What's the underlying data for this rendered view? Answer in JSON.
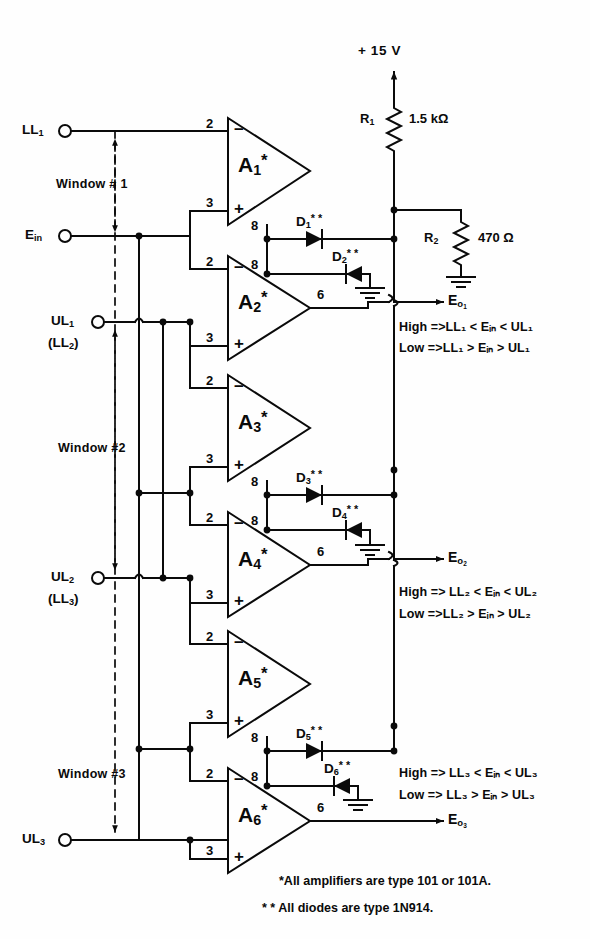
{
  "figure": {
    "type": "schematic",
    "supply": {
      "label": "+ 15 V"
    },
    "footnotes": [
      "*All amplifiers are type 101 or 101A.",
      "* * All diodes are type 1N914."
    ]
  },
  "terminals": [
    {
      "name": "ll1",
      "label": "LL",
      "sub": "1"
    },
    {
      "name": "ein",
      "label": "E",
      "sub": "in"
    },
    {
      "name": "ul1",
      "label": "UL",
      "sub": "1"
    },
    {
      "name": "ul1b",
      "label": "(LL",
      "sub": "2",
      "tail": ")"
    },
    {
      "name": "ul2",
      "label": "UL",
      "sub": "2"
    },
    {
      "name": "ul2b",
      "label": "(LL",
      "sub": "3",
      "tail": ")"
    },
    {
      "name": "ul3",
      "label": "UL",
      "sub": "3"
    }
  ],
  "windows": [
    {
      "label": "Window # 1"
    },
    {
      "label": "Window #2"
    },
    {
      "label": "Window  #3"
    }
  ],
  "amplifiers": [
    {
      "name": "a1",
      "label": "A",
      "sub": "1",
      "star": "*",
      "pin_minus": "2",
      "pin_plus": "3",
      "pin_8": "8",
      "pin_out": ""
    },
    {
      "name": "a2",
      "label": "A",
      "sub": "2",
      "star": "*",
      "pin_minus": "2",
      "pin_plus": "3",
      "pin_8": "8",
      "pin_out": "6"
    },
    {
      "name": "a3",
      "label": "A",
      "sub": "3",
      "star": "*",
      "pin_minus": "2",
      "pin_plus": "3",
      "pin_8": "8",
      "pin_out": ""
    },
    {
      "name": "a4",
      "label": "A",
      "sub": "4",
      "star": "*",
      "pin_minus": "2",
      "pin_plus": "3",
      "pin_8": "8",
      "pin_out": "6"
    },
    {
      "name": "a5",
      "label": "A",
      "sub": "5",
      "star": "*",
      "pin_minus": "2",
      "pin_plus": "3",
      "pin_8": "8",
      "pin_out": ""
    },
    {
      "name": "a6",
      "label": "A",
      "sub": "6",
      "star": "*",
      "pin_minus": "2",
      "pin_plus": "3",
      "pin_8": "8",
      "pin_out": "6"
    }
  ],
  "diodes": [
    {
      "name": "d1",
      "label": "D",
      "sub": "1",
      "stars": "* *",
      "direction": "right"
    },
    {
      "name": "d2",
      "label": "D",
      "sub": "2",
      "stars": "* *",
      "direction": "left"
    },
    {
      "name": "d3",
      "label": "D",
      "sub": "3",
      "stars": "* *",
      "direction": "right"
    },
    {
      "name": "d4",
      "label": "D",
      "sub": "4",
      "stars": "* *",
      "direction": "left"
    },
    {
      "name": "d5",
      "label": "D",
      "sub": "5",
      "stars": "* *",
      "direction": "right"
    },
    {
      "name": "d6",
      "label": "D",
      "sub": "6",
      "stars": "* *",
      "direction": "left"
    }
  ],
  "resistors": [
    {
      "name": "r1",
      "label": "R",
      "sub": "1",
      "value": "1.5 kΩ"
    },
    {
      "name": "r2",
      "label": "R",
      "sub": "2",
      "value": "470 Ω"
    }
  ],
  "outputs": [
    {
      "name": "eo1",
      "label": "E",
      "sub": "o₁"
    },
    {
      "name": "eo2",
      "label": "E",
      "sub": "o₂"
    },
    {
      "name": "eo3",
      "label": "E",
      "sub": "o₃"
    }
  ],
  "annotations": [
    {
      "name": "window1-logic",
      "high": "High =>LL₁ < Eᵢₙ < UL₁",
      "low": "Low =>LL₁ > Eᵢₙ > UL₁"
    },
    {
      "name": "window2-logic",
      "high": "High => LL₂ < Eᵢₙ < UL₂",
      "low": "Low =>LL₂ > Eᵢₙ > UL₂"
    },
    {
      "name": "window3-logic",
      "high": "High => LL₃ < Eᵢₙ < UL₃",
      "low": "Low => LL₃ > Eᵢₙ > UL₃"
    }
  ],
  "colors": {
    "ink": "#0a0a0a",
    "paper": "#fefefe"
  }
}
